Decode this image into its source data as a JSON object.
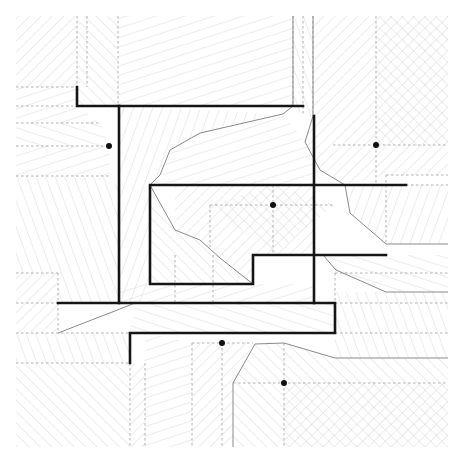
{
  "diagram": {
    "title": "",
    "type": "medial-axis / straight-skeleton hatching diagram",
    "bounds": {
      "x0": 16,
      "y0": 16,
      "x1": 448,
      "y1": 447
    },
    "colors": {
      "background": "#ffffff",
      "hatch": "#cfcfcf",
      "dashed": "#a8a8a8",
      "thin_boundary": "#8a8a8a",
      "wall": "#151515",
      "dot": "#111111"
    },
    "walls": [
      {
        "id": "top-left-hook",
        "points": [
          [
            77,
            87
          ],
          [
            77,
            106
          ],
          [
            303,
            106
          ]
        ]
      },
      {
        "id": "left-vertical",
        "points": [
          [
            119,
            106
          ],
          [
            119,
            303
          ]
        ]
      },
      {
        "id": "inner-rect",
        "points": [
          [
            406,
            185
          ],
          [
            150,
            185
          ],
          [
            150,
            284
          ],
          [
            253,
            284
          ],
          [
            253,
            255
          ],
          [
            386,
            255
          ]
        ]
      },
      {
        "id": "right-vertical",
        "points": [
          [
            314,
            116
          ],
          [
            314,
            303
          ]
        ]
      },
      {
        "id": "lower-bar",
        "points": [
          [
            58,
            303
          ],
          [
            335,
            303
          ],
          [
            335,
            333
          ],
          [
            130,
            333
          ],
          [
            130,
            363
          ]
        ]
      }
    ],
    "dots": [
      {
        "id": "dot-left",
        "x": 109,
        "y": 146
      },
      {
        "id": "dot-top-right",
        "x": 376,
        "y": 145
      },
      {
        "id": "dot-center",
        "x": 273,
        "y": 205
      },
      {
        "id": "dot-lower-mid",
        "x": 222,
        "y": 343
      },
      {
        "id": "dot-bottom",
        "x": 284,
        "y": 383
      }
    ],
    "dashed_lines": [
      [
        [
          16,
          87
        ],
        [
          77,
          87
        ]
      ],
      [
        [
          16,
          106
        ],
        [
          77,
          106
        ]
      ],
      [
        [
          16,
          123
        ],
        [
          100,
          123
        ]
      ],
      [
        [
          16,
          146
        ],
        [
          109,
          146
        ]
      ],
      [
        [
          16,
          176
        ],
        [
          110,
          176
        ]
      ],
      [
        [
          77,
          16
        ],
        [
          77,
          87
        ]
      ],
      [
        [
          87,
          16
        ],
        [
          87,
          87
        ]
      ],
      [
        [
          118,
          16
        ],
        [
          118,
          106
        ]
      ],
      [
        [
          293,
          16
        ],
        [
          293,
          106
        ]
      ],
      [
        [
          303,
          16
        ],
        [
          303,
          116
        ]
      ],
      [
        [
          313,
          16
        ],
        [
          313,
          116
        ]
      ],
      [
        [
          376,
          16
        ],
        [
          376,
          145
        ]
      ],
      [
        [
          333,
          145
        ],
        [
          448,
          145
        ]
      ],
      [
        [
          376,
          145
        ],
        [
          376,
          185
        ]
      ],
      [
        [
          16,
          273
        ],
        [
          58,
          273
        ]
      ],
      [
        [
          16,
          303
        ],
        [
          58,
          303
        ]
      ],
      [
        [
          16,
          333
        ],
        [
          130,
          333
        ]
      ],
      [
        [
          16,
          363
        ],
        [
          130,
          363
        ]
      ],
      [
        [
          58,
          273
        ],
        [
          58,
          303
        ]
      ],
      [
        [
          58,
          303
        ],
        [
          58,
          333
        ]
      ],
      [
        [
          130,
          363
        ],
        [
          130,
          447
        ]
      ],
      [
        [
          145,
          363
        ],
        [
          145,
          447
        ]
      ],
      [
        [
          192,
          343
        ],
        [
          192,
          447
        ]
      ],
      [
        [
          222,
          343
        ],
        [
          222,
          447
        ]
      ],
      [
        [
          192,
          343
        ],
        [
          253,
          343
        ]
      ],
      [
        [
          284,
          343
        ],
        [
          284,
          447
        ]
      ],
      [
        [
          233,
          383
        ],
        [
          448,
          383
        ]
      ],
      [
        [
          335,
          273
        ],
        [
          335,
          333
        ]
      ],
      [
        [
          335,
          273
        ],
        [
          448,
          273
        ]
      ],
      [
        [
          335,
          303
        ],
        [
          448,
          303
        ]
      ],
      [
        [
          335,
          333
        ],
        [
          448,
          333
        ]
      ],
      [
        [
          386,
          175
        ],
        [
          448,
          175
        ]
      ],
      [
        [
          386,
          175
        ],
        [
          386,
          244
        ]
      ],
      [
        [
          406,
          185
        ],
        [
          448,
          185
        ]
      ],
      [
        [
          273,
          185
        ],
        [
          273,
          255
        ]
      ],
      [
        [
          210,
          205
        ],
        [
          335,
          205
        ]
      ],
      [
        [
          210,
          205
        ],
        [
          210,
          248
        ]
      ],
      [
        [
          175,
          255
        ],
        [
          175,
          303
        ]
      ],
      [
        [
          213,
          255
        ],
        [
          213,
          303
        ]
      ]
    ],
    "thin_boundaries": [
      [
        [
          293,
          16
        ],
        [
          293,
          106
        ],
        [
          283,
          114
        ],
        [
          200,
          133
        ],
        [
          170,
          150
        ],
        [
          160,
          175
        ],
        [
          150,
          185
        ]
      ],
      [
        [
          313,
          16
        ],
        [
          313,
          116
        ],
        [
          305,
          142
        ],
        [
          320,
          170
        ],
        [
          345,
          185
        ],
        [
          350,
          213
        ],
        [
          386,
          244
        ],
        [
          448,
          244
        ]
      ],
      [
        [
          150,
          185
        ],
        [
          175,
          230
        ],
        [
          200,
          240
        ],
        [
          220,
          258
        ],
        [
          253,
          284
        ]
      ],
      [
        [
          323,
          255
        ],
        [
          336,
          270
        ],
        [
          386,
          292
        ],
        [
          448,
          292
        ]
      ],
      [
        [
          58,
          333
        ],
        [
          120,
          309
        ],
        [
          135,
          303
        ]
      ],
      [
        [
          233,
          447
        ],
        [
          233,
          383
        ],
        [
          255,
          344
        ],
        [
          284,
          343
        ],
        [
          335,
          358
        ],
        [
          448,
          358
        ]
      ]
    ]
  }
}
